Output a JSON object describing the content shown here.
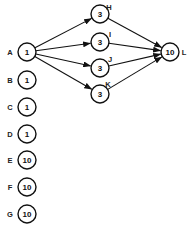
{
  "diagram": {
    "type": "network-graph",
    "nodes": [
      {
        "id": "A",
        "label": "A",
        "value": "1",
        "x": 27,
        "y": 52,
        "label_dx": -17,
        "label_dy": 3
      },
      {
        "id": "B",
        "label": "B",
        "value": "1",
        "x": 27,
        "y": 80,
        "label_dx": -17,
        "label_dy": 3
      },
      {
        "id": "C",
        "label": "C",
        "value": "1",
        "x": 27,
        "y": 107,
        "label_dx": -17,
        "label_dy": 3
      },
      {
        "id": "D",
        "label": "D",
        "value": "1",
        "x": 27,
        "y": 134,
        "label_dx": -17,
        "label_dy": 3
      },
      {
        "id": "E",
        "label": "E",
        "value": "10",
        "x": 27,
        "y": 160,
        "label_dx": -17,
        "label_dy": 3
      },
      {
        "id": "F",
        "label": "F",
        "value": "10",
        "x": 27,
        "y": 187,
        "label_dx": -17,
        "label_dy": 3
      },
      {
        "id": "G",
        "label": "G",
        "value": "10",
        "x": 27,
        "y": 214,
        "label_dx": -17,
        "label_dy": 3
      },
      {
        "id": "H",
        "label": "H",
        "value": "3",
        "x": 100,
        "y": 14,
        "label_dx": 9,
        "label_dy": -4
      },
      {
        "id": "I",
        "label": "I",
        "value": "3",
        "x": 100,
        "y": 42,
        "label_dx": 10,
        "label_dy": -5
      },
      {
        "id": "J",
        "label": "J",
        "value": "3",
        "x": 100,
        "y": 68,
        "label_dx": 10,
        "label_dy": -6
      },
      {
        "id": "K",
        "label": "K",
        "value": "3",
        "x": 100,
        "y": 94,
        "label_dx": 8,
        "label_dy": -7
      },
      {
        "id": "L",
        "label": "L",
        "value": "10",
        "x": 170,
        "y": 52,
        "label_dx": 14,
        "label_dy": 3
      }
    ],
    "edges": [
      {
        "from": "A",
        "to": "H"
      },
      {
        "from": "A",
        "to": "I"
      },
      {
        "from": "A",
        "to": "J"
      },
      {
        "from": "A",
        "to": "K"
      },
      {
        "from": "H",
        "to": "L"
      },
      {
        "from": "I",
        "to": "L"
      },
      {
        "from": "J",
        "to": "L"
      },
      {
        "from": "K",
        "to": "L"
      }
    ],
    "node_radius": 9,
    "caption": "                    "
  }
}
